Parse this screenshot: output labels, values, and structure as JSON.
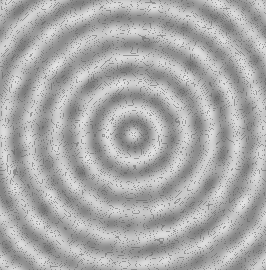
{
  "image": {
    "description": "Grayscale contour plot of concentric circular interference rings",
    "alt_text": "Concentric ring interference pattern with contour lines"
  },
  "pattern": {
    "center_x": 133,
    "center_y": 134,
    "ring_spacing_px": 26,
    "contour_levels": 14,
    "noise_amplitude": 0.35,
    "base_gray": "#9a9a9a",
    "dark_gray": "#6e6e6e",
    "light_gray": "#f0f0f0",
    "line_color": "#5a5a5a",
    "right_border_color": "#ffffff"
  }
}
